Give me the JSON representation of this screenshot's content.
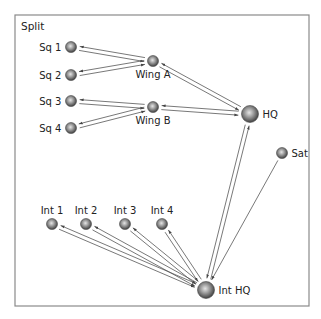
{
  "diagram": {
    "title": "Split",
    "frame": {
      "x": 15,
      "y": 15,
      "width": 294,
      "height": 291
    },
    "colors": {
      "frame": "#8a8a8a",
      "edge": "#555555",
      "node_light": "#e0e0e0",
      "node_dark": "#3a3a3a",
      "text": "#222222"
    },
    "nodes": [
      {
        "id": "sq1",
        "label": "Sq 1",
        "x": 71,
        "y": 47,
        "r": 5.5,
        "label_pos": "left"
      },
      {
        "id": "sq2",
        "label": "Sq 2",
        "x": 71,
        "y": 75,
        "r": 5.5,
        "label_pos": "left"
      },
      {
        "id": "sq3",
        "label": "Sq 3",
        "x": 71,
        "y": 101,
        "r": 5.5,
        "label_pos": "left"
      },
      {
        "id": "sq4",
        "label": "Sq 4",
        "x": 71,
        "y": 128,
        "r": 5.5,
        "label_pos": "left"
      },
      {
        "id": "wingA",
        "label": "Wing A",
        "x": 153,
        "y": 61,
        "r": 5.5,
        "label_pos": "below"
      },
      {
        "id": "wingB",
        "label": "Wing B",
        "x": 153,
        "y": 107,
        "r": 5.5,
        "label_pos": "below"
      },
      {
        "id": "hq",
        "label": "HQ",
        "x": 250,
        "y": 114,
        "r": 8.5,
        "label_pos": "right"
      },
      {
        "id": "sat",
        "label": "Sat",
        "x": 282,
        "y": 153,
        "r": 5.5,
        "label_pos": "right"
      },
      {
        "id": "int1",
        "label": "Int 1",
        "x": 52,
        "y": 224,
        "r": 5.5,
        "label_pos": "above"
      },
      {
        "id": "int2",
        "label": "Int 2",
        "x": 86,
        "y": 224,
        "r": 5.5,
        "label_pos": "above"
      },
      {
        "id": "int3",
        "label": "Int 3",
        "x": 125,
        "y": 224,
        "r": 5.5,
        "label_pos": "above"
      },
      {
        "id": "int4",
        "label": "Int 4",
        "x": 162,
        "y": 224,
        "r": 5.5,
        "label_pos": "above"
      },
      {
        "id": "inthq",
        "label": "Int HQ",
        "x": 206,
        "y": 290,
        "r": 8.5,
        "label_pos": "right"
      }
    ],
    "edges": [
      {
        "from": "sq1",
        "to": "wingA",
        "bidirectional": true
      },
      {
        "from": "sq2",
        "to": "wingA",
        "bidirectional": true
      },
      {
        "from": "sq3",
        "to": "wingB",
        "bidirectional": true
      },
      {
        "from": "sq4",
        "to": "wingB",
        "bidirectional": true
      },
      {
        "from": "wingA",
        "to": "hq",
        "bidirectional": true
      },
      {
        "from": "wingB",
        "to": "hq",
        "bidirectional": true
      },
      {
        "from": "inthq",
        "to": "hq",
        "bidirectional": true
      },
      {
        "from": "sat",
        "to": "inthq",
        "bidirectional": false
      },
      {
        "from": "int1",
        "to": "inthq",
        "bidirectional": true
      },
      {
        "from": "int2",
        "to": "inthq",
        "bidirectional": true
      },
      {
        "from": "int3",
        "to": "inthq",
        "bidirectional": true
      },
      {
        "from": "int4",
        "to": "inthq",
        "bidirectional": true
      }
    ]
  }
}
